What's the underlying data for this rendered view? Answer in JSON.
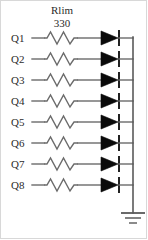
{
  "diagram": {
    "type": "circuit-schematic",
    "background_color": "#ffffff",
    "wire_color": "#6b6b6b",
    "diode_color": "#0a0a0a",
    "text_color": "#2b2b2b",
    "component_group_label": {
      "name": "Rlim",
      "value": "330"
    },
    "channels": [
      {
        "pin": "Q1"
      },
      {
        "pin": "Q2"
      },
      {
        "pin": "Q3"
      },
      {
        "pin": "Q4"
      },
      {
        "pin": "Q5"
      },
      {
        "pin": "Q6"
      },
      {
        "pin": "Q7"
      },
      {
        "pin": "Q8"
      }
    ],
    "nets": {
      "common_cathode_rail": "common cathode bus",
      "ground": "ground"
    },
    "symbols": {
      "resistor": "resistor-zigzag",
      "diode": "led-diode",
      "ground": "earth-ground"
    },
    "geometry": {
      "row_y": [
        38,
        59,
        80,
        101,
        122,
        143,
        164,
        185
      ],
      "label_x": 11,
      "wire_start_x": 32,
      "resistor_x": 44,
      "resistor_width": 34,
      "wire_end_x": 100,
      "diode_x": 101,
      "diode_width": 17,
      "cathode_x": 119,
      "rail_x": 133,
      "ground_y": 213,
      "value_label_x": 62,
      "name_label_y": 14,
      "value_label_y": 27
    }
  }
}
